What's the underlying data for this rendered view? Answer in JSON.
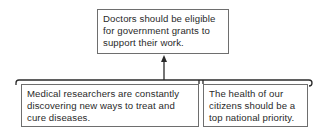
{
  "diagram": {
    "type": "argument-map",
    "claim": {
      "lines": [
        "Doctors should be eligible",
        "for government grants to",
        "support their work."
      ]
    },
    "reasons": [
      {
        "lines": [
          "Medical researchers are constantly",
          "discovering new ways to treat and",
          "cure diseases."
        ]
      },
      {
        "lines": [
          "The health of our",
          "citizens should be a",
          "top national priority."
        ]
      }
    ],
    "connector": {
      "type": "bracket-with-arrow",
      "direction": "up",
      "from": "reasons",
      "to": "claim"
    },
    "colors": {
      "border": "#6e6e6e",
      "line": "#2a2a2a",
      "text": "#2a2a2a",
      "background": "#ffffff"
    }
  }
}
